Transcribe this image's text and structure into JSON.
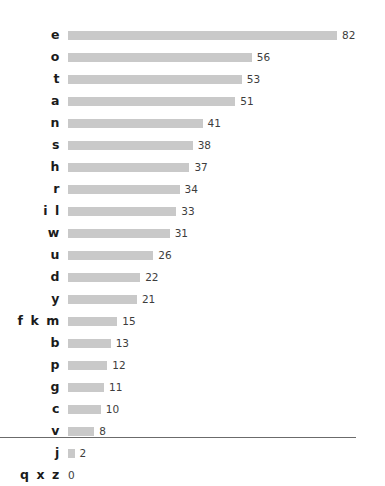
{
  "chart_data": {
    "type": "bar",
    "orientation": "horizontal",
    "title": "",
    "subtitle": "",
    "xlabel": "",
    "ylabel": "",
    "xlim": [
      0,
      82
    ],
    "ylim": null,
    "grid": false,
    "legend": null,
    "bar_color": "#c9c9c9",
    "label_color": "#1b1b1b",
    "value_color": "#3d3d3d",
    "axis_color": "#6b6b6b",
    "value_labels_shown": true,
    "tick_labels": [],
    "categories": [
      "e",
      "o",
      "t",
      "a",
      "n",
      "s",
      "h",
      "r",
      "i l",
      "w",
      "u",
      "d",
      "y",
      "f k m",
      "b",
      "p",
      "g",
      "c",
      "v",
      "j",
      "q x z"
    ],
    "values": [
      82,
      56,
      53,
      51,
      41,
      38,
      37,
      34,
      33,
      31,
      26,
      22,
      21,
      15,
      13,
      12,
      11,
      10,
      8,
      2,
      0
    ],
    "rows": [
      {
        "label": "e",
        "value": 82,
        "value_text": "82"
      },
      {
        "label": "o",
        "value": 56,
        "value_text": "56"
      },
      {
        "label": "t",
        "value": 53,
        "value_text": "53"
      },
      {
        "label": "a",
        "value": 51,
        "value_text": "51"
      },
      {
        "label": "n",
        "value": 41,
        "value_text": "41"
      },
      {
        "label": "s",
        "value": 38,
        "value_text": "38"
      },
      {
        "label": "h",
        "value": 37,
        "value_text": "37"
      },
      {
        "label": "r",
        "value": 34,
        "value_text": "34"
      },
      {
        "label": "i l",
        "value": 33,
        "value_text": "33"
      },
      {
        "label": "w",
        "value": 31,
        "value_text": "31"
      },
      {
        "label": "u",
        "value": 26,
        "value_text": "26"
      },
      {
        "label": "d",
        "value": 22,
        "value_text": "22"
      },
      {
        "label": "y",
        "value": 21,
        "value_text": "21"
      },
      {
        "label": "f k m",
        "value": 15,
        "value_text": "15"
      },
      {
        "label": "b",
        "value": 13,
        "value_text": "13"
      },
      {
        "label": "p",
        "value": 12,
        "value_text": "12"
      },
      {
        "label": "g",
        "value": 11,
        "value_text": "11"
      },
      {
        "label": "c",
        "value": 10,
        "value_text": "10"
      },
      {
        "label": "v",
        "value": 8,
        "value_text": "8"
      },
      {
        "label": "j",
        "value": 2,
        "value_text": "2"
      },
      {
        "label": "q x z",
        "value": 0,
        "value_text": "0"
      }
    ]
  }
}
